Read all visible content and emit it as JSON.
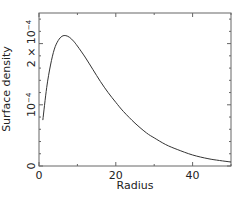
{
  "chart_data": {
    "type": "line",
    "title": "",
    "xlabel": "Radius",
    "ylabel": "Surface density",
    "xlim": [
      0,
      50
    ],
    "ylim": [
      0,
      0.00025
    ],
    "grid": false,
    "legend": "none",
    "x_ticks": [
      {
        "value": 0,
        "label": "0"
      },
      {
        "value": 20,
        "label": "20"
      },
      {
        "value": 40,
        "label": "40"
      }
    ],
    "x_minor_ticks": [
      10,
      30,
      50
    ],
    "y_ticks": [
      {
        "value": 0,
        "label": "0",
        "base": "0",
        "exp": ""
      },
      {
        "value": 0.0001,
        "label": "10^-4",
        "base": "10",
        "exp": "−4"
      },
      {
        "value": 0.0002,
        "label": "2×10^-4",
        "base": "2 × 10",
        "exp": "−4"
      }
    ],
    "y_minor_ticks": [
      2e-05,
      4e-05,
      6e-05,
      8e-05,
      0.00012,
      0.00014,
      0.00016,
      0.00018,
      0.00022,
      0.00024
    ],
    "series": [
      {
        "name": "surface density",
        "color": "#333333",
        "x": [
          1,
          2,
          3,
          4,
          5,
          6,
          7,
          8,
          9,
          10,
          12,
          14,
          16,
          18,
          20,
          22,
          25,
          28,
          30,
          33,
          36,
          40,
          44,
          47,
          50
        ],
        "y": [
          7.5e-05,
          0.000128,
          0.000165,
          0.000191,
          0.000205,
          0.000212,
          0.000213,
          0.00021,
          0.000204,
          0.000196,
          0.000178,
          0.000158,
          0.000138,
          0.00012,
          0.000104,
          8.9e-05,
          7e-05,
          5.4e-05,
          4.6e-05,
          3.5e-05,
          2.7e-05,
          1.8e-05,
          1.2e-05,
          9e-06,
          6.5e-06
        ]
      }
    ]
  }
}
